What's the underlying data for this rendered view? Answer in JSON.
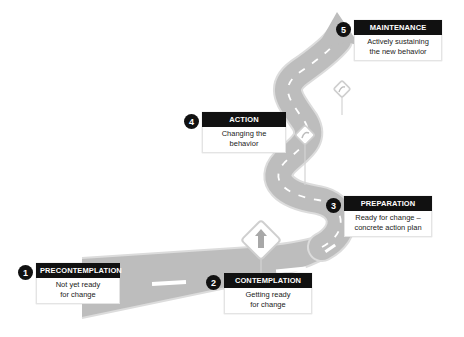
{
  "diagram": {
    "type": "stages-of-change-road",
    "colors": {
      "road": "#b9b9b9",
      "road_edge": "#d8d8d8",
      "lane_marking": "#ffffff",
      "label_header": "#111111",
      "badge": "#111111",
      "sign_border": "#cccccc"
    },
    "stages": [
      {
        "number": "1",
        "title": "PRECONTEMPLATION",
        "description_lines": [
          "Not yet ready",
          "for change"
        ]
      },
      {
        "number": "2",
        "title": "CONTEMPLATION",
        "description_lines": [
          "Getting ready",
          "for change"
        ]
      },
      {
        "number": "3",
        "title": "PREPARATION",
        "description_lines": [
          "Ready for change –",
          "concrete action plan"
        ]
      },
      {
        "number": "4",
        "title": "ACTION",
        "description_lines": [
          "Changing the",
          "behavior"
        ]
      },
      {
        "number": "5",
        "title": "MAINTENANCE",
        "description_lines": [
          "Actively sustaining",
          "the new behavior"
        ]
      }
    ],
    "signs": [
      {
        "icon": "straight-ahead-arrow-sign"
      },
      {
        "icon": "curve-sign"
      },
      {
        "icon": "curve-sign"
      }
    ]
  }
}
